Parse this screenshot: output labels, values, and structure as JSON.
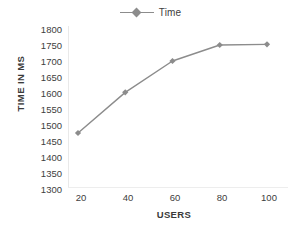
{
  "chart_data": {
    "type": "line",
    "title": "",
    "xlabel": "USERS",
    "ylabel": "TIME IN MS",
    "categories": [
      20,
      40,
      60,
      80,
      100
    ],
    "x": [
      20,
      40,
      60,
      80,
      100
    ],
    "series": [
      {
        "name": "Time",
        "values": [
          1475,
          1602,
          1700,
          1750,
          1752
        ],
        "color": "#8c8c8c",
        "marker": "diamond"
      }
    ],
    "xlim": [
      10,
      110
    ],
    "ylim": [
      1300,
      1800
    ],
    "xticks": [
      "20",
      "40",
      "60",
      "80",
      "100"
    ],
    "yticks": [
      "1300",
      "1350",
      "1400",
      "1450",
      "1500",
      "1550",
      "1600",
      "1650",
      "1700",
      "1750",
      "1800"
    ],
    "grid": false,
    "legend": {
      "position": "top-center",
      "entries": [
        "Time"
      ]
    }
  },
  "legend": {
    "series_label": "Time"
  },
  "axes": {
    "y_title": "TIME IN MS",
    "x_title": "USERS",
    "y_tick_labels": [
      "1800",
      "1750",
      "1700",
      "1650",
      "1600",
      "1550",
      "1500",
      "1450",
      "1400",
      "1350",
      "1300"
    ],
    "x_tick_labels": [
      "20",
      "40",
      "60",
      "80",
      "100"
    ]
  },
  "colors": {
    "series": "#8c8c8c",
    "text": "#404040",
    "axis": "#e9e9e9",
    "background": "#ffffff"
  }
}
